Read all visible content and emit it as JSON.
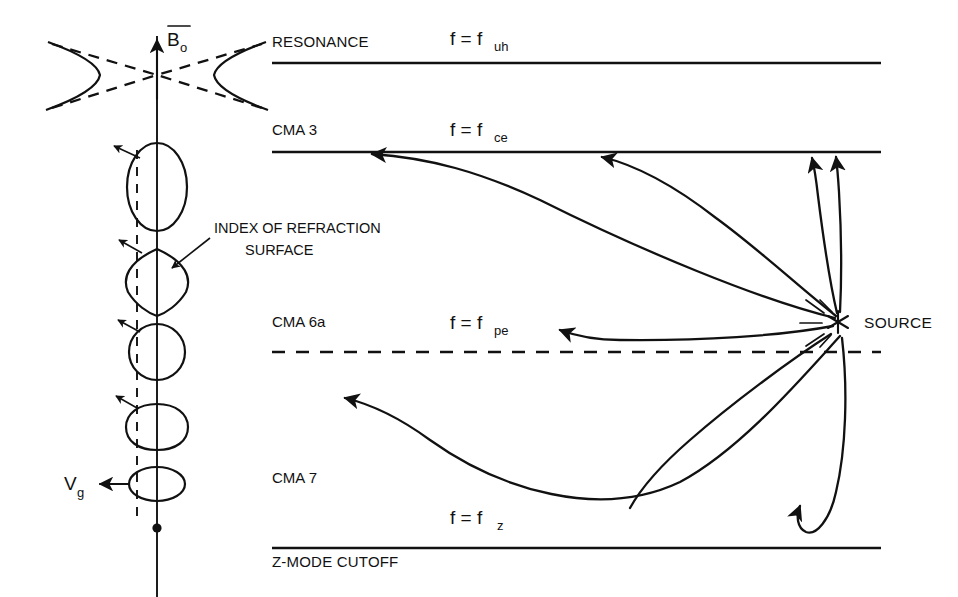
{
  "figure": {
    "type": "physics-ray-diagram"
  },
  "boundaries": [
    {
      "id": "uh",
      "name_label": "RESONANCE",
      "freq_main": "f = f",
      "freq_sub": "uh",
      "style": "solid",
      "y": 63
    },
    {
      "id": "ce",
      "name_label": "",
      "freq_main": "f = f",
      "freq_sub": "ce",
      "style": "solid",
      "y": 152
    },
    {
      "id": "pe",
      "name_label": "",
      "freq_main": "f = f",
      "freq_sub": "pe",
      "style": "dashed",
      "y": 352
    },
    {
      "id": "z",
      "name_label": "Z-MODE CUTOFF",
      "freq_main": "f = f",
      "freq_sub": "z",
      "style": "solid",
      "y": 548
    }
  ],
  "regions": [
    {
      "id": "cma3",
      "label": "CMA 3"
    },
    {
      "id": "cma6a",
      "label": "CMA 6a"
    },
    {
      "id": "cma7",
      "label": "CMA 7"
    }
  ],
  "annotations": {
    "source_label": "SOURCE",
    "index_surface_line1": "INDEX OF REFRACTION",
    "index_surface_line2": "SURFACE",
    "b_field_main": "B",
    "b_field_sub": "o",
    "group_velocity_main": "V",
    "group_velocity_sub": "g"
  },
  "colors": {
    "ink": "#111111",
    "background": "#ffffff"
  },
  "left_panel": {
    "caption": "index-of-refraction surfaces along the magnetic field direction",
    "surfaces": [
      {
        "id": "hyperbola",
        "shape": "open-hyperbola-with-asymptotes"
      },
      {
        "id": "tall-oval",
        "shape": "prolate-ellipse"
      },
      {
        "id": "lens",
        "shape": "lens-lemon"
      },
      {
        "id": "circle",
        "shape": "near-circle"
      },
      {
        "id": "peanut",
        "shape": "bilobed-peanut"
      },
      {
        "id": "flat-oval",
        "shape": "oblate-ellipse"
      },
      {
        "id": "point",
        "shape": "point"
      }
    ]
  }
}
